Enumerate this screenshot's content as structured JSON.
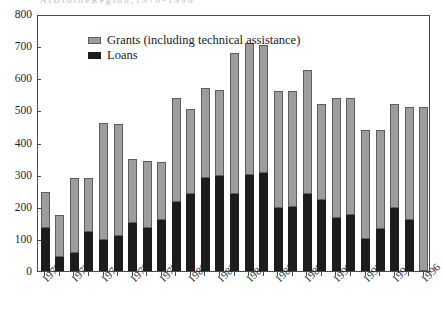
{
  "title_cut_off": "A I D   t o   t h e   R e g i o n ,   1 9 7 0 - 1 9 9 6",
  "legend": {
    "items": [
      {
        "label": "Grants (including technical assistance)",
        "color": "#9d9d9d",
        "key": "grants"
      },
      {
        "label": "Loans",
        "color": "#1c1c1c",
        "key": "loans"
      }
    ]
  },
  "chart_data": {
    "type": "bar",
    "stacked": true,
    "title": "",
    "xlabel": "",
    "ylabel": "",
    "ylim": [
      0,
      800
    ],
    "yticks": [
      0,
      100,
      200,
      300,
      400,
      500,
      600,
      700,
      800
    ],
    "ytick_labels": [
      "0",
      "100",
      "200",
      "300",
      "400",
      "500",
      "600",
      "700",
      "800"
    ],
    "grid": false,
    "legend_position": "top-left",
    "categories": [
      "1970",
      "1971",
      "1972",
      "1973",
      "1974",
      "1975",
      "1976",
      "1977",
      "1978",
      "1979",
      "1980",
      "1981",
      "1982",
      "1983",
      "1984",
      "1985",
      "1986",
      "1987",
      "1988",
      "1989",
      "1990",
      "1991",
      "1992",
      "1993",
      "1994",
      "1995",
      "1996"
    ],
    "xtick_labels": [
      "1970",
      "1972",
      "1974",
      "1976",
      "1978",
      "1980",
      "1982",
      "1984",
      "1986",
      "1988",
      "1990",
      "1992",
      "1994",
      "1996"
    ],
    "series": [
      {
        "name": "Loans",
        "color": "#1c1c1c",
        "values": [
          135,
          45,
          55,
          120,
          95,
          110,
          150,
          135,
          160,
          215,
          240,
          290,
          295,
          240,
          300,
          305,
          195,
          200,
          240,
          220,
          165,
          175,
          100,
          130,
          195,
          160,
          0
        ]
      },
      {
        "name": "Grants (including technical assistance)",
        "color": "#9d9d9d",
        "values": [
          110,
          128,
          235,
          168,
          365,
          348,
          200,
          207,
          180,
          325,
          265,
          280,
          270,
          440,
          410,
          400,
          365,
          360,
          385,
          300,
          375,
          365,
          340,
          310,
          325,
          350,
          510
        ]
      }
    ],
    "totals": [
      245,
      173,
      290,
      288,
      460,
      458,
      350,
      342,
      340,
      540,
      505,
      570,
      565,
      680,
      710,
      705,
      560,
      560,
      625,
      520,
      540,
      540,
      440,
      440,
      520,
      510,
      510
    ]
  }
}
